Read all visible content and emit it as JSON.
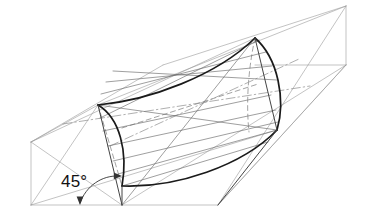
{
  "figure": {
    "annotations": {
      "angle_label": "45°"
    },
    "colors": {
      "background": "#ffffff",
      "heavy_line": "#1a1a1a",
      "construction_line": "#9a9a9a",
      "medium_line": "#555555",
      "hidden_line": "#8c8c8c",
      "text": "#111111"
    },
    "line_weights": {
      "heavy": 1.7,
      "medium": 0.9,
      "construction": 0.6
    },
    "geometry": {
      "frame_vertices": {
        "left_top": [
          31,
          142
        ],
        "left_bottom": [
          31,
          205
        ],
        "mid_bottom": [
          122,
          205
        ],
        "right_bottom": [
          218,
          205
        ],
        "right_top_apex": [
          346,
          6
        ],
        "right_mid": [
          346,
          65
        ],
        "top_left_ridge": [
          98,
          105
        ],
        "top_mid_ridge": [
          163,
          65
        ],
        "top_apex": [
          255,
          38
        ]
      },
      "directrix_left": {
        "top": [
          98,
          105
        ],
        "bottom": [
          122,
          186
        ],
        "bulge": "convex-right"
      },
      "directrix_right": {
        "top": [
          255,
          38
        ],
        "bottom": [
          277,
          130
        ],
        "bulge": "convex-right"
      },
      "generatrix_upper": {
        "from": [
          98,
          105
        ],
        "to": [
          255,
          38
        ],
        "sag": "concave-down"
      },
      "generatrix_lower": {
        "from": [
          122,
          186
        ],
        "to": [
          277,
          130
        ],
        "sag": "concave-up"
      },
      "ruling_count": 9,
      "centerline_style": "dash-dot"
    },
    "angle_arrow": {
      "arc_from": [
        78,
        202
      ],
      "arc_to": [
        122,
        177
      ],
      "arrowheads": 2,
      "label_position": [
        62,
        187
      ]
    }
  }
}
